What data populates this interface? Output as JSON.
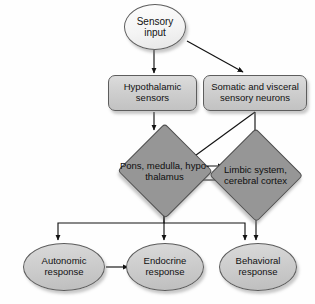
{
  "diagram": {
    "colors": {
      "background": "#ffffff",
      "ellipse_top_fill": "#f7f7f7",
      "rounded_box_fill": "#cfcfcf",
      "diamond_fill": "#969696",
      "ellipse_bottom_fill": "#cccccc",
      "outline": "#5d5d5d",
      "arrow": "#111111",
      "text": "#111111"
    },
    "nodes": [
      {
        "id": "sensory-input",
        "label": "Sensory\ninput",
        "shape": "ellipse"
      },
      {
        "id": "hypothalamic-sensors",
        "label": "Hypothalamic\nsensors",
        "shape": "rounded-rectangle"
      },
      {
        "id": "somatic-visceral-sensory-neurons",
        "label": "Somatic and visceral\nsensory neurons",
        "shape": "rounded-rectangle"
      },
      {
        "id": "pons-medulla-hypothalamus",
        "label": "Pons,\nmedulla,\nhypo-\nthalamus",
        "shape": "diamond"
      },
      {
        "id": "limbic-system-cerebral-cortex",
        "label": "Limbic\nsystem,\ncerebral\ncortex",
        "shape": "diamond"
      },
      {
        "id": "autonomic-response",
        "label": "Autonomic\nresponse",
        "shape": "ellipse"
      },
      {
        "id": "endocrine-response",
        "label": "Endocrine\nresponse",
        "shape": "ellipse"
      },
      {
        "id": "behavioral-response",
        "label": "Behavioral\nresponse",
        "shape": "ellipse"
      }
    ],
    "edges": [
      {
        "from": "sensory-input",
        "to": "hypothalamic-sensors",
        "style": "straight-down"
      },
      {
        "from": "sensory-input",
        "to": "somatic-visceral-sensory-neurons",
        "style": "diagonal"
      },
      {
        "from": "hypothalamic-sensors",
        "to": "pons-medulla-hypothalamus",
        "style": "straight-down"
      },
      {
        "from": "somatic-visceral-sensory-neurons",
        "to": "pons-medulla-hypothalamus",
        "style": "diagonal"
      },
      {
        "from": "somatic-visceral-sensory-neurons",
        "to": "limbic-system-cerebral-cortex",
        "style": "straight-down"
      },
      {
        "from": "pons-medulla-hypothalamus",
        "to": "limbic-system-cerebral-cortex",
        "style": "horizontal"
      },
      {
        "from": "limbic-system-cerebral-cortex",
        "to": "pons-medulla-hypothalamus",
        "style": "horizontal"
      },
      {
        "from": "pons-medulla-hypothalamus",
        "to": "autonomic-response",
        "style": "bus-branch"
      },
      {
        "from": "pons-medulla-hypothalamus",
        "to": "endocrine-response",
        "style": "bus-branch"
      },
      {
        "from": "pons-medulla-hypothalamus",
        "to": "behavioral-response",
        "style": "bus-branch"
      },
      {
        "from": "limbic-system-cerebral-cortex",
        "to": "behavioral-response",
        "style": "straight-down"
      },
      {
        "from": "autonomic-response",
        "to": "endocrine-response",
        "style": "horizontal"
      }
    ]
  }
}
